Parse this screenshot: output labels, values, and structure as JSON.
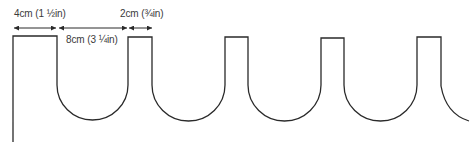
{
  "diagram": {
    "type": "pattern-template",
    "line_color": "#2a2a2a",
    "background": "#ffffff",
    "dimensions": [
      {
        "id": "tab-width",
        "label": "4cm (1 ½in)",
        "from_x": 13,
        "to_x": 57
      },
      {
        "id": "notch-width",
        "label": "8cm (3 ¼in)",
        "from_x": 58,
        "to_x": 128
      },
      {
        "id": "narrow-tab-width",
        "label": "2cm (¾in)",
        "from_x": 128,
        "to_x": 152
      }
    ],
    "shape": {
      "first_tab": {
        "left": 13,
        "right": 57,
        "top": 36
      },
      "notches": [
        {
          "left": 57,
          "right": 128,
          "bottom": 120
        },
        {
          "left": 152,
          "right": 225,
          "bottom": 121
        },
        {
          "left": 248,
          "right": 321,
          "bottom": 121
        },
        {
          "left": 344,
          "right": 417,
          "bottom": 121
        }
      ],
      "tabs": [
        {
          "left": 128,
          "right": 152,
          "top": 37
        },
        {
          "left": 225,
          "right": 248,
          "top": 37
        },
        {
          "left": 321,
          "right": 344,
          "top": 38
        },
        {
          "left": 417,
          "right": 441,
          "top": 37
        }
      ]
    }
  }
}
